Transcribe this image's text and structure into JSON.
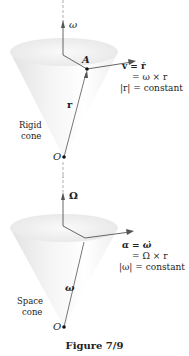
{
  "figures": [
    {
      "id": "rigid",
      "axis_label": "ω",
      "point_label": "A",
      "origin_label": "O",
      "vector_label": "r",
      "cone_label_line1": "Rigid",
      "cone_label_line2": "cone",
      "equations": [
        "v = ṙ",
        "= ω × r",
        "|r| = constant"
      ]
    },
    {
      "id": "space",
      "axis_label": "Ω",
      "origin_label": "O",
      "vector_label": "ω",
      "cone_label_line1": "Space",
      "cone_label_line2": "cone",
      "equations": [
        "α = ω̇",
        "= Ω × r",
        "|ω| = constant"
      ]
    }
  ],
  "caption": "Figure 7/9",
  "colors": {
    "line": "#555555",
    "cone_light": "#ffffff",
    "cone_shade": "#d6d6d6"
  }
}
